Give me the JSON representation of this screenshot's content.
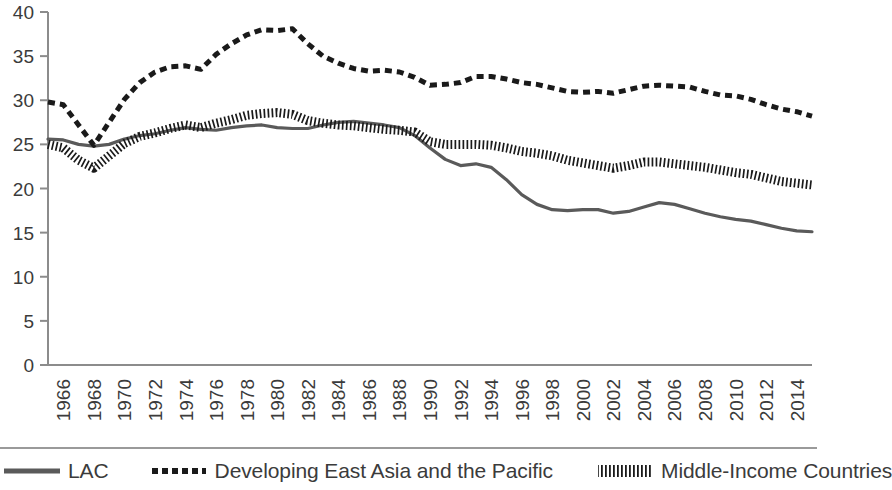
{
  "chart_data": {
    "type": "line",
    "title": "",
    "xlabel": "",
    "ylabel": "",
    "ylim": [
      0,
      40
    ],
    "ytick_step": 5,
    "yticks": [
      0,
      5,
      10,
      15,
      20,
      25,
      30,
      35,
      40
    ],
    "grid": false,
    "legend_position": "bottom",
    "xlim": [
      1965,
      2015
    ],
    "x": [
      1965,
      1966,
      1967,
      1968,
      1969,
      1970,
      1971,
      1972,
      1973,
      1974,
      1975,
      1976,
      1977,
      1978,
      1979,
      1980,
      1981,
      1982,
      1983,
      1984,
      1985,
      1986,
      1987,
      1988,
      1989,
      1990,
      1991,
      1992,
      1993,
      1994,
      1995,
      1996,
      1997,
      1998,
      1999,
      2000,
      2001,
      2002,
      2003,
      2004,
      2005,
      2006,
      2007,
      2008,
      2009,
      2010,
      2011,
      2012,
      2013,
      2014,
      2015
    ],
    "tick_labels": [
      "1966",
      "1968",
      "1970",
      "1972",
      "1974",
      "1976",
      "1978",
      "1980",
      "1982",
      "1984",
      "1986",
      "1988",
      "1990",
      "1992",
      "1994",
      "1996",
      "1998",
      "2000",
      "2002",
      "2004",
      "2006",
      "2008",
      "2010",
      "2012",
      "2014"
    ],
    "series": [
      {
        "name": "LAC",
        "style": "solid",
        "color": "#5a5a5a",
        "values": [
          25.6,
          25.5,
          25.0,
          24.8,
          25.0,
          25.6,
          26.0,
          26.2,
          26.6,
          26.9,
          26.7,
          26.6,
          26.9,
          27.1,
          27.2,
          26.9,
          26.8,
          26.8,
          27.2,
          27.5,
          27.6,
          27.4,
          27.2,
          26.9,
          26.0,
          24.6,
          23.3,
          22.6,
          22.8,
          22.4,
          21.0,
          19.3,
          18.2,
          17.6,
          17.5,
          17.6,
          17.6,
          17.2,
          17.4,
          17.9,
          18.4,
          18.2,
          17.7,
          17.2,
          16.8,
          16.5,
          16.3,
          15.9,
          15.5,
          15.2,
          15.1
        ]
      },
      {
        "name": "Developing East Asia and the Pacific",
        "style": "dashed",
        "color": "#1a1a1a",
        "values": [
          29.8,
          29.5,
          27.2,
          24.9,
          27.5,
          30.1,
          32.0,
          33.2,
          33.8,
          33.9,
          33.5,
          35.2,
          36.4,
          37.4,
          38.0,
          37.9,
          38.1,
          36.4,
          35.0,
          34.2,
          33.6,
          33.3,
          33.4,
          33.2,
          32.6,
          31.7,
          31.8,
          32.0,
          32.7,
          32.7,
          32.4,
          32.0,
          31.8,
          31.4,
          31.0,
          30.9,
          31.0,
          30.8,
          31.2,
          31.6,
          31.7,
          31.6,
          31.5,
          31.0,
          30.6,
          30.5,
          30.1,
          29.5,
          29.0,
          28.7,
          28.2
        ]
      },
      {
        "name": "Middle-Income Countries",
        "style": "fine-dot",
        "color": "#1a1a1a",
        "values": [
          25.0,
          24.6,
          23.2,
          22.3,
          23.7,
          25.1,
          25.9,
          26.3,
          26.8,
          27.2,
          26.9,
          27.4,
          27.8,
          28.3,
          28.5,
          28.6,
          28.4,
          27.7,
          27.4,
          27.2,
          27.1,
          26.9,
          26.7,
          26.6,
          26.4,
          25.3,
          25.0,
          25.0,
          25.0,
          24.9,
          24.6,
          24.2,
          24.0,
          23.7,
          23.2,
          22.9,
          22.6,
          22.3,
          22.6,
          23.0,
          23.0,
          22.8,
          22.6,
          22.4,
          22.1,
          21.8,
          21.6,
          21.2,
          20.8,
          20.6,
          20.4
        ]
      }
    ]
  },
  "legend": {
    "items": [
      {
        "label": "LAC"
      },
      {
        "label": "Developing East Asia and the Pacific"
      },
      {
        "label": "Middle-Income Countries"
      }
    ]
  }
}
